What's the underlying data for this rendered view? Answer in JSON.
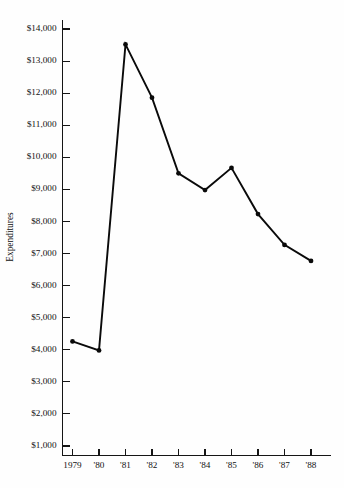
{
  "chart_data": {
    "type": "line",
    "title": "",
    "xlabel": "",
    "ylabel": "Expenditures",
    "categories": [
      "1979",
      "'80",
      "'81",
      "'82",
      "'83",
      "'84",
      "'85",
      "'86",
      "'87",
      "'88"
    ],
    "x_values": [
      1979,
      1980,
      1981,
      1982,
      1983,
      1984,
      1985,
      1986,
      1987,
      1988
    ],
    "values": [
      4260,
      3980,
      13520,
      11860,
      9500,
      8980,
      9670,
      8230,
      7270,
      6770
    ],
    "series": [
      {
        "name": "Expenditures",
        "values": [
          4260,
          3980,
          13520,
          11860,
          9500,
          8980,
          9670,
          8230,
          7270,
          6770
        ]
      }
    ],
    "ylim": [
      1000,
      14000
    ],
    "y_ticks": [
      1000,
      2000,
      3000,
      4000,
      5000,
      6000,
      7000,
      8000,
      9000,
      10000,
      11000,
      12000,
      13000,
      14000
    ],
    "y_tick_labels": [
      "$1,000",
      "$2,000",
      "$3,000",
      "$4,000",
      "$5,000",
      "$6,000",
      "$7,000",
      "$8,000",
      "$9,000",
      "$10,000",
      "$11,000",
      "$12,000",
      "$13,000",
      "$14,000"
    ],
    "x_tick_labels": [
      "1979",
      "'80",
      "'81",
      "'82",
      "'83",
      "'84",
      "'85",
      "'86",
      "'87",
      "'88"
    ],
    "grid": false,
    "legend": false,
    "legend_position": "none",
    "marker": "filled-circle",
    "line_color": "#0a0a0a",
    "axis_color": "#151515",
    "background_color": "#fefefe"
  }
}
